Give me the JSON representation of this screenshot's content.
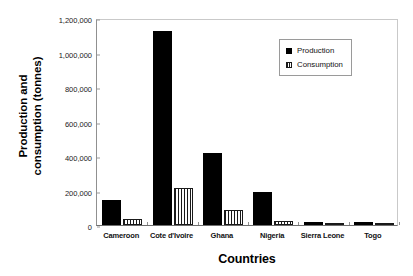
{
  "chart_data": {
    "type": "bar",
    "title": "",
    "xlabel": "Countries",
    "ylabel_line1": "Production and",
    "ylabel_line2": "consumption (tonnes)",
    "categories": [
      "Cameroon",
      "Cote d'Ivoire",
      "Ghana",
      "Nigeria",
      "Sierra Leone",
      "Togo"
    ],
    "series": [
      {
        "name": "Production",
        "color": "#000000",
        "fill": "solid",
        "values": [
          145000,
          1125000,
          420000,
          190000,
          15000,
          20000
        ]
      },
      {
        "name": "Consumption",
        "color": "#ffffff",
        "fill": "vertical-stripes",
        "values": [
          35000,
          215000,
          85000,
          25000,
          5000,
          5000
        ]
      }
    ],
    "ylim": [
      0,
      1200000
    ],
    "ytick_values": [
      0,
      200000,
      400000,
      600000,
      800000,
      1000000,
      1200000
    ],
    "ytick_labels": [
      "0",
      "200,000",
      "400,000",
      "600,000",
      "800,000",
      "1,000,000",
      "1,200,000"
    ],
    "grid": false,
    "legend_position": "top-right",
    "legend_entries": [
      "Production",
      "Consumption"
    ]
  }
}
